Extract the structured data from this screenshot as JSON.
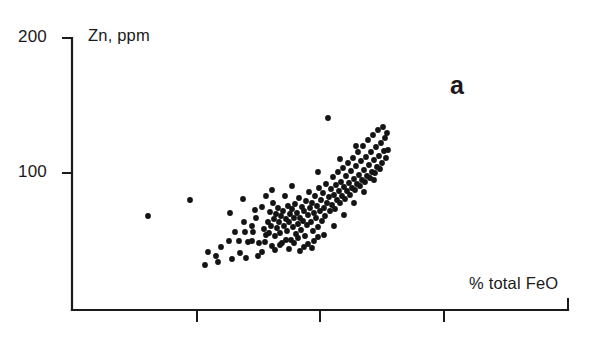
{
  "figure": {
    "panel_label": "a",
    "background_color": "#ffffff",
    "ink_color": "#1a1a1a"
  },
  "chart_data": {
    "type": "scatter",
    "title": "",
    "subtitle": "",
    "xlabel": "% total FeO",
    "ylabel": "Zn, ppm",
    "annotations": [
      {
        "text": "a",
        "x_px": 455,
        "y_px": 85
      }
    ],
    "grid": false,
    "legend": null,
    "legend_position": "none",
    "marker": {
      "shape": "circle",
      "color": "#141414",
      "size_px": 3.2
    },
    "xaxis": {
      "tick_labels": [],
      "tick_positions_px": [
        197,
        320,
        444,
        568
      ],
      "axis_start_px": 72,
      "axis_end_px": 568,
      "axis_y_px": 310,
      "range_shown": "unlabeled"
    },
    "yaxis": {
      "tick_labels": [
        "200",
        "100"
      ],
      "tick_values": [
        200,
        100
      ],
      "tick_positions_px": [
        38,
        173
      ],
      "axis_top_px": 38,
      "axis_bottom_px": 310,
      "ylim": [
        0,
        200
      ]
    },
    "series": [
      {
        "name": "samples",
        "n_points": 168,
        "points_px": [
          [
            148,
            216
          ],
          [
            190,
            200
          ],
          [
            205,
            265
          ],
          [
            218,
            262
          ],
          [
            221,
            247
          ],
          [
            229,
            241
          ],
          [
            235,
            232
          ],
          [
            239,
            241
          ],
          [
            240,
            253
          ],
          [
            243,
            199
          ],
          [
            245,
            232
          ],
          [
            248,
            242
          ],
          [
            252,
            241
          ],
          [
            253,
            232
          ],
          [
            256,
            218
          ],
          [
            259,
            243
          ],
          [
            262,
            207
          ],
          [
            264,
            229
          ],
          [
            265,
            242
          ],
          [
            266,
            196
          ],
          [
            268,
            222
          ],
          [
            269,
            233
          ],
          [
            270,
            212
          ],
          [
            271,
            226
          ],
          [
            272,
            246
          ],
          [
            273,
            203
          ],
          [
            274,
            219
          ],
          [
            275,
            236
          ],
          [
            276,
            214
          ],
          [
            277,
            228
          ],
          [
            278,
            208
          ],
          [
            279,
            222
          ],
          [
            280,
            233
          ],
          [
            281,
            216
          ],
          [
            282,
            243
          ],
          [
            283,
            211
          ],
          [
            284,
            226
          ],
          [
            285,
            196
          ],
          [
            286,
            219
          ],
          [
            287,
            231
          ],
          [
            288,
            206
          ],
          [
            289,
            222
          ],
          [
            290,
            214
          ],
          [
            291,
            240
          ],
          [
            292,
            209
          ],
          [
            293,
            227
          ],
          [
            294,
            218
          ],
          [
            295,
            204
          ],
          [
            296,
            234
          ],
          [
            297,
            213
          ],
          [
            298,
            224
          ],
          [
            299,
            198
          ],
          [
            300,
            218
          ],
          [
            301,
            230
          ],
          [
            302,
            207
          ],
          [
            303,
            221
          ],
          [
            304,
            211
          ],
          [
            305,
            236
          ],
          [
            306,
            201
          ],
          [
            307,
            225
          ],
          [
            308,
            215
          ],
          [
            309,
            192
          ],
          [
            310,
            208
          ],
          [
            311,
            222
          ],
          [
            312,
            203
          ],
          [
            313,
            231
          ],
          [
            314,
            213
          ],
          [
            315,
            196
          ],
          [
            316,
            218
          ],
          [
            317,
            206
          ],
          [
            318,
            227
          ],
          [
            319,
            188
          ],
          [
            320,
            211
          ],
          [
            321,
            200
          ],
          [
            322,
            221
          ],
          [
            323,
            193
          ],
          [
            324,
            208
          ],
          [
            325,
            216
          ],
          [
            326,
            184
          ],
          [
            327,
            203
          ],
          [
            328,
            118
          ],
          [
            329,
            197
          ],
          [
            330,
            211
          ],
          [
            331,
            189
          ],
          [
            332,
            205
          ],
          [
            333,
            177
          ],
          [
            334,
            195
          ],
          [
            335,
            209
          ],
          [
            336,
            185
          ],
          [
            337,
            200
          ],
          [
            338,
            172
          ],
          [
            339,
            191
          ],
          [
            340,
            203
          ],
          [
            341,
            182
          ],
          [
            342,
            196
          ],
          [
            343,
            168
          ],
          [
            344,
            187
          ],
          [
            345,
            199
          ],
          [
            346,
            176
          ],
          [
            347,
            191
          ],
          [
            348,
            163
          ],
          [
            349,
            183
          ],
          [
            350,
            195
          ],
          [
            351,
            171
          ],
          [
            352,
            188
          ],
          [
            353,
            158
          ],
          [
            354,
            179
          ],
          [
            355,
            190
          ],
          [
            356,
            166
          ],
          [
            357,
            184
          ],
          [
            358,
            152
          ],
          [
            359,
            175
          ],
          [
            360,
            186
          ],
          [
            361,
            161
          ],
          [
            362,
            180
          ],
          [
            363,
            146
          ],
          [
            364,
            170
          ],
          [
            365,
            182
          ],
          [
            366,
            157
          ],
          [
            367,
            176
          ],
          [
            368,
            140
          ],
          [
            369,
            165
          ],
          [
            370,
            178
          ],
          [
            371,
            152
          ],
          [
            372,
            172
          ],
          [
            373,
            135
          ],
          [
            374,
            160
          ],
          [
            375,
            173
          ],
          [
            376,
            147
          ],
          [
            377,
            167
          ],
          [
            378,
            130
          ],
          [
            379,
            156
          ],
          [
            380,
            169
          ],
          [
            381,
            143
          ],
          [
            382,
            163
          ],
          [
            383,
            127
          ],
          [
            384,
            151
          ],
          [
            385,
            138
          ],
          [
            386,
            158
          ],
          [
            387,
            133
          ],
          [
            388,
            150
          ],
          [
            262,
            252
          ],
          [
            275,
            250
          ],
          [
            289,
            249
          ],
          [
            300,
            251
          ],
          [
            312,
            248
          ],
          [
            246,
            258
          ],
          [
            258,
            256
          ],
          [
            232,
            259
          ],
          [
            216,
            256
          ],
          [
            208,
            252
          ],
          [
            286,
            240
          ],
          [
            298,
            238
          ],
          [
            308,
            244
          ],
          [
            318,
            237
          ],
          [
            252,
            226
          ],
          [
            266,
            235
          ],
          [
            280,
            245
          ],
          [
            294,
            243
          ],
          [
            304,
            247
          ],
          [
            314,
            241
          ],
          [
            324,
            235
          ],
          [
            334,
            226
          ],
          [
            344,
            215
          ],
          [
            354,
            203
          ],
          [
            364,
            192
          ],
          [
            374,
            180
          ],
          [
            230,
            213
          ],
          [
            244,
            222
          ],
          [
            255,
            210
          ],
          [
            272,
            190
          ],
          [
            292,
            186
          ],
          [
            318,
            172
          ],
          [
            340,
            159
          ],
          [
            356,
            146
          ]
        ],
        "x_units": "% total FeO",
        "y_units": "Zn, ppm",
        "description": "Positively correlated scatter of Zn (ppm) against % total FeO, dense cluster rising left-to-right with one high outlier near the top of the trend"
      }
    ]
  }
}
